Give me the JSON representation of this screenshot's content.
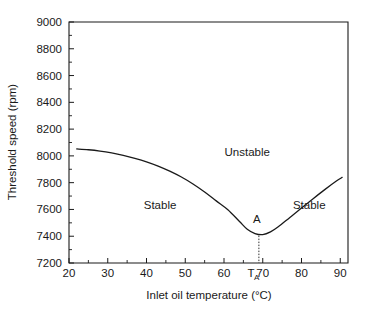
{
  "chart_data": {
    "type": "line",
    "title": "",
    "xlabel": "Inlet oil temperature (°C)",
    "ylabel": "Threshold speed (rpm)",
    "xlim": [
      20,
      92
    ],
    "ylim": [
      7200,
      9000
    ],
    "grid": false,
    "legend": "none",
    "x_ticks": [
      20,
      30,
      40,
      50,
      60,
      70,
      80,
      90
    ],
    "x_tick_labels": [
      "20",
      "30",
      "40",
      "50",
      "60",
      "70",
      "80",
      "90"
    ],
    "x_minor_tick_step": 5,
    "y_ticks": [
      7200,
      7400,
      7600,
      7800,
      8000,
      8200,
      8400,
      8600,
      8800,
      9000
    ],
    "y_tick_labels": [
      "7200",
      "7400",
      "7600",
      "7800",
      "8000",
      "8200",
      "8400",
      "8600",
      "8800",
      "9000"
    ],
    "y_minor_tick_step": 100,
    "series": [
      {
        "name": "Threshold speed boundary",
        "x": [
          22,
          25,
          28,
          31,
          34,
          37,
          40,
          43,
          46,
          49,
          52,
          55,
          58,
          61,
          64,
          66,
          68,
          70,
          72,
          74,
          77,
          80,
          83,
          86,
          89,
          90.5
        ],
        "y": [
          8052,
          8046,
          8036,
          8022,
          8004,
          7982,
          7956,
          7924,
          7886,
          7842,
          7790,
          7730,
          7664,
          7598,
          7510,
          7452,
          7420,
          7412,
          7432,
          7470,
          7540,
          7610,
          7680,
          7748,
          7812,
          7840
        ]
      }
    ],
    "annotations": [
      {
        "name": "unstable-region-label",
        "text": "Unstable",
        "x": 66,
        "y": 8000
      },
      {
        "name": "stable-left-region-label",
        "text": "Stable",
        "x": 43.5,
        "y": 7600
      },
      {
        "name": "stable-right-region-label",
        "text": "Stable",
        "x": 82,
        "y": 7600
      },
      {
        "name": "point-a-label",
        "text": "A",
        "x": 68.5,
        "y": 7500
      },
      {
        "name": "ta-axis-label",
        "text": "T",
        "subscript": "A",
        "x": 67,
        "y": 7200
      }
    ],
    "marker_point": {
      "name": "A",
      "x": 69,
      "y": 7412
    },
    "axis_colors": {
      "line": "#1a1a1a",
      "curve": "#1a1a1a",
      "text": "#1a1a1a",
      "background": "#ffffff"
    }
  }
}
